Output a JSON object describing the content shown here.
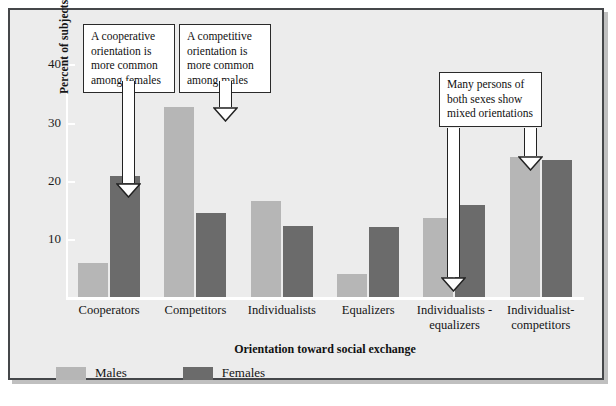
{
  "chart_data": {
    "type": "bar",
    "title": "",
    "xlabel": "Orientation toward social exchange",
    "ylabel": "Percent of subjects showing each orientation",
    "categories": [
      "Cooperators",
      "Competitors",
      "Individualists",
      "Equalizers",
      "Individualists -\nequalizers",
      "Individualist-\ncompetitors"
    ],
    "series": [
      {
        "name": "Males",
        "color": "#b6b6b6",
        "values": [
          5.8,
          32.7,
          16.5,
          3.9,
          13.6,
          24.0
        ]
      },
      {
        "name": "Females",
        "color": "#6b6b6b",
        "values": [
          20.9,
          14.4,
          12.2,
          12.0,
          15.8,
          23.5
        ]
      }
    ],
    "ylim": [
      0,
      43
    ],
    "yticks": [
      10,
      20,
      30,
      40
    ],
    "ytick_labels": [
      "10",
      "20",
      "30",
      "40"
    ],
    "grid": false,
    "legend_position": "bottom-left"
  },
  "annotations": [
    {
      "id": "callout-1",
      "text": "A cooperative orientation is more common among females"
    },
    {
      "id": "callout-2",
      "text": "A competitive orientation is more common among males"
    },
    {
      "id": "callout-3",
      "text": "Many persons of both sexes show mixed orientations"
    }
  ],
  "legend": {
    "items": [
      {
        "label": "Males",
        "color": "#b6b6b6"
      },
      {
        "label": "Females",
        "color": "#6b6b6b"
      }
    ]
  },
  "colors": {
    "males": "#b6b6b6",
    "females": "#6b6b6b",
    "background": "#ececec",
    "frame": "#45474a",
    "axis": "#ffffff",
    "text": "#111111"
  }
}
